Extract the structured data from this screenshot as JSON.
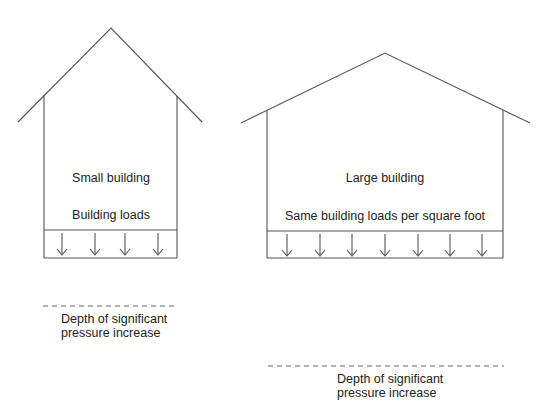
{
  "diagram": {
    "small_building": {
      "title": "Small building",
      "load_label": "Building loads",
      "depth_label_line1": "Depth of significant",
      "depth_label_line2": "pressure increase",
      "arrow_count": 4
    },
    "large_building": {
      "title": "Large building",
      "load_label": "Same building loads per square foot",
      "depth_label_line1": "Depth of significant",
      "depth_label_line2": "pressure increase",
      "arrow_count": 7
    },
    "colors": {
      "line": "#555555",
      "text": "#222222",
      "background": "#ffffff"
    }
  }
}
